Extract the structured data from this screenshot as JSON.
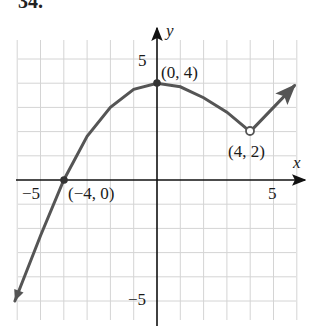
{
  "problem": {
    "number": "34."
  },
  "colors": {
    "grid": "#d4d4d4",
    "axis": "#111111",
    "curve": "#555555",
    "background": "#ffffff"
  },
  "chart_data": {
    "type": "line",
    "title": "",
    "xlabel": "x",
    "ylabel": "y",
    "xlim": [
      -6,
      6
    ],
    "ylim": [
      -6,
      6
    ],
    "grid": true,
    "x_ticks_labeled": [
      -5,
      5
    ],
    "y_ticks_labeled": [
      5,
      -5
    ],
    "tick_labels": {
      "x_neg": "−5",
      "x_pos": "5",
      "y_pos": "5",
      "y_neg": "−5"
    },
    "series": [
      {
        "name": "piece-1 (parabola, arrow at left end)",
        "description": "Downward-opening curve through (-4,0) with vertex (0,4), continuing to open circle at (4,2); left end extends with arrow",
        "x": [
          -6.1,
          -5,
          -4,
          -3,
          -2,
          -1,
          0,
          1,
          2,
          3,
          4
        ],
        "values": [
          -5.0,
          -2.3,
          0,
          1.8,
          3.0,
          3.75,
          4,
          3.85,
          3.4,
          2.8,
          2.0
        ]
      },
      {
        "name": "piece-2 (ray, arrow at right end)",
        "description": "Line starting at (4,2) rising with slope 1",
        "x": [
          4,
          6
        ],
        "values": [
          2,
          4
        ]
      }
    ],
    "points": [
      {
        "label": "(0, 4)",
        "x": 0,
        "y": 4,
        "style": "closed"
      },
      {
        "label": "(−4, 0)",
        "x": -4,
        "y": 0,
        "style": "closed"
      },
      {
        "label": "(4, 2)",
        "x": 4,
        "y": 2,
        "style": "open"
      }
    ],
    "annotations": [
      "(0, 4)",
      "(−4, 0)",
      "(4, 2)"
    ]
  }
}
